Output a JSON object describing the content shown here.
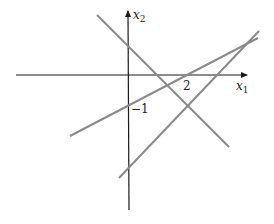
{
  "diagram": {
    "type": "coordinate-plane-lines",
    "axes": {
      "x_label": "x",
      "x_subscript": "1",
      "y_label": "x",
      "y_subscript": "2"
    },
    "tick_labels": {
      "x_tick": "2",
      "y_tick": "−1"
    },
    "colors": {
      "axis": "#1a1a1a",
      "line": "#8a8a8a",
      "text": "#222222"
    },
    "lines": [
      {
        "name": "descending-line",
        "from": [
          97,
          15
        ],
        "to": [
          229,
          147
        ]
      },
      {
        "name": "shallow-ascending-line",
        "from": [
          70,
          136
        ],
        "to": [
          258,
          38
        ]
      },
      {
        "name": "steep-ascending-line",
        "from": [
          119,
          178
        ],
        "to": [
          259,
          31
        ]
      }
    ]
  }
}
